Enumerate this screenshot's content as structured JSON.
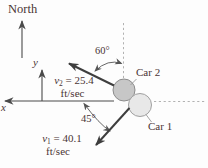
{
  "colors": {
    "text": "#4a3434",
    "vector": "#3e3e3e",
    "axis": "#4a4a4a",
    "thin_line": "#555555",
    "leader": "#999999",
    "dashed": "#b2b2b2",
    "car1_fill": "#e8e8e8",
    "car1_stroke": "#a0a0a0",
    "car2_fill": "#c7c7c7",
    "car2_stroke": "#8c8c8c",
    "background": "#fdfdfd"
  },
  "compass": {
    "label": "North"
  },
  "axes": {
    "x_label": "x",
    "y_label": "y"
  },
  "angles": {
    "v2_from_north": "60°",
    "v1_from_horizontal": "45°"
  },
  "cars": {
    "car1": {
      "label": "Car 1"
    },
    "car2": {
      "label": "Car 2"
    }
  },
  "velocities": {
    "v1": {
      "symbol": "v",
      "subscript": "1",
      "value": " = 40.1",
      "unit": "ft/sec"
    },
    "v2": {
      "symbol": "v",
      "subscript": "2",
      "value": " = 25.4",
      "unit": "ft/sec"
    }
  }
}
